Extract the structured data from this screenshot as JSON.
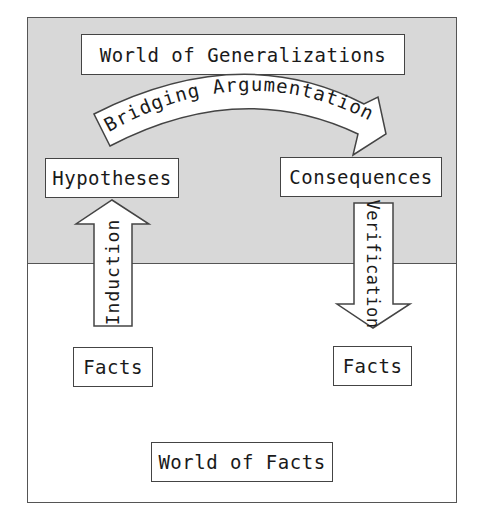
{
  "diagram": {
    "zones": {
      "top": {
        "label": "World of Generalizations",
        "color": "#d8d8d8"
      },
      "bottom": {
        "label": "World of Facts",
        "color": "#ffffff"
      }
    },
    "nodes": {
      "hypotheses": "Hypotheses",
      "consequences": "Consequences",
      "facts_left": "Facts",
      "facts_right": "Facts"
    },
    "arrows": {
      "bridging": "Bridging Argumentation",
      "induction": "Induction",
      "verification": "Verification"
    },
    "border_color": "#444444"
  }
}
